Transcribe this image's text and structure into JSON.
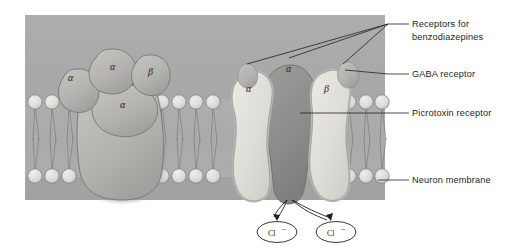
{
  "figure": {
    "panel": {
      "background_color": "#a8a8a8",
      "x": 25,
      "y": 15,
      "width": 360,
      "height": 185
    },
    "colors": {
      "panel_bg": "#a8a8a8",
      "membrane_band": "#b0b0b0",
      "lipid_head": "#d8d8d8",
      "lipid_head_stroke": "#8f8f8f",
      "lipid_tail": "#8a8a8a",
      "subunit_light": "#e3e2de",
      "subunit_mid": "#b9b8b4",
      "subunit_dark": "#8e8e8c",
      "outline": "#6f6f6f",
      "label_text": "#231f20",
      "leader_line": "#231f20"
    }
  },
  "left_complex": {
    "caption": "Three-dimensional view of the pentameric receptor complex",
    "subunits": [
      {
        "id": "left-alpha",
        "label": "α",
        "x": 68,
        "y": 78
      },
      {
        "id": "top-alpha",
        "label": "α",
        "x": 112,
        "y": 67
      },
      {
        "id": "right-beta",
        "label": "β",
        "x": 150,
        "y": 72
      },
      {
        "id": "front-alpha",
        "label": "α",
        "x": 121,
        "y": 105
      }
    ]
  },
  "right_complex": {
    "caption": "Cross-sectional view of the receptor showing the chloride channel",
    "subunits": [
      {
        "id": "cross-alpha-left",
        "label": "α",
        "x": 247,
        "y": 88
      },
      {
        "id": "cross-alpha-center",
        "label": "α",
        "x": 290,
        "y": 68
      },
      {
        "id": "cross-beta-right",
        "label": "β",
        "x": 326,
        "y": 88
      }
    ]
  },
  "ions": [
    {
      "id": "chloride-left",
      "label": "Cl",
      "superscript": "–",
      "cx": 277,
      "cy": 228
    },
    {
      "id": "chloride-right",
      "label": "Cl",
      "superscript": "–",
      "cx": 336,
      "cy": 228
    }
  ],
  "labels": [
    {
      "id": "receptors-for-benzodiazepines",
      "lines": [
        "Receptors for",
        "benzodiazepines"
      ],
      "text_x": 412,
      "text_y": 27,
      "leader": {
        "x1": 388,
        "y1": 24,
        "x2": 409,
        "y2": 24
      },
      "pointers": [
        {
          "x1": 388,
          "y1": 24,
          "x2": 247,
          "y2": 64
        },
        {
          "x1": 388,
          "y1": 24,
          "x2": 288,
          "y2": 57
        },
        {
          "x1": 388,
          "y1": 24,
          "x2": 340,
          "y2": 63
        }
      ]
    },
    {
      "id": "gaba-receptor",
      "lines": [
        "GABA receptor"
      ],
      "text_x": 412,
      "text_y": 77,
      "leader": {
        "x1": 388,
        "y1": 74,
        "x2": 409,
        "y2": 74
      },
      "pointers": [
        {
          "x1": 388,
          "y1": 74,
          "x2": 344,
          "y2": 69
        }
      ]
    },
    {
      "id": "picrotoxin-receptor",
      "lines": [
        "Picrotoxin receptor"
      ],
      "text_x": 412,
      "text_y": 116,
      "leader": {
        "x1": 388,
        "y1": 113,
        "x2": 409,
        "y2": 113
      },
      "pointers": [
        {
          "x1": 388,
          "y1": 113,
          "x2": 300,
          "y2": 113
        }
      ]
    },
    {
      "id": "neuron-membrane",
      "lines": [
        "Neuron membrane"
      ],
      "text_x": 412,
      "text_y": 183,
      "leader": {
        "x1": 381,
        "y1": 180,
        "x2": 409,
        "y2": 180
      },
      "pointers": []
    }
  ],
  "membrane": {
    "top_band_y": 99,
    "bottom_band_y": 176,
    "lipid_head_radius": 7.2,
    "left_heads_top_x": [
      35,
      52,
      69
    ],
    "left_heads_bottom_x": [
      35,
      52,
      69
    ],
    "right_heads_top_x": [
      162,
      179,
      196,
      213
    ],
    "right_heads_bottom_x": [
      162,
      179,
      196,
      213
    ],
    "far_right_heads_top_x": [
      348,
      365,
      380
    ],
    "far_right_heads_bottom_x": [
      348,
      365,
      380
    ]
  }
}
